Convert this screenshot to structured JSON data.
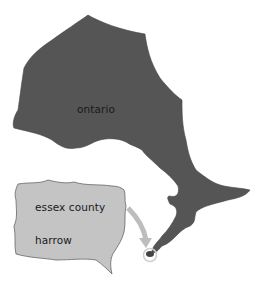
{
  "map": {
    "labels": {
      "province": "ontario",
      "county": "essex county",
      "town": "harrow"
    },
    "colors": {
      "province_fill": "#555555",
      "county_fill": "#c4c4c4",
      "arrow": "#bdbdbd",
      "highlight_ring": "#c8c8c8",
      "background": "#ffffff"
    }
  }
}
